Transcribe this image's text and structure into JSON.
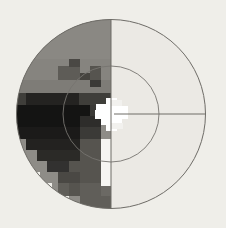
{
  "figure": {
    "name": "visual-field-grayscale-plot",
    "title": "",
    "background_color": "#efeee9"
  },
  "chart_data": {
    "type": "heatmap",
    "title": "",
    "subtitle": "",
    "xlabel": "",
    "ylabel": "",
    "legend": [],
    "annotations": [],
    "grid": false,
    "projection": "polar",
    "xlim": [
      -30,
      30
    ],
    "ylim": [
      -30,
      30
    ],
    "center": {
      "x": 111,
      "y": 114
    },
    "cell_size": 10.5,
    "geometry": {
      "outer_circle_radius": 95,
      "inner_circle_radius": 48,
      "vertical_meridian": true,
      "horizontal_meridian_right_only": true,
      "fixation_marker": "white-star-cross"
    },
    "gray_levels": {
      "background": "#efeee9",
      "near_white": "#ffffff",
      "very_light": "#ebe9e4",
      "light": "#dedcd6",
      "mid_light": "#bdbab3",
      "mid": "#8e8c87",
      "mid_dark": "#66645f",
      "dark": "#3b3a37",
      "very_dark": "#1b1a19",
      "black": "#0d0d0c",
      "line": "#6e6c67"
    },
    "cells": [
      {
        "cx": -5,
        "cy": 5,
        "w": 1,
        "h": 1,
        "level": "mid"
      },
      {
        "cx": -4,
        "cy": 5,
        "w": 1,
        "h": 1,
        "level": "mid"
      },
      {
        "cx": -3,
        "cy": 5,
        "w": 1,
        "h": 1,
        "level": "mid"
      },
      {
        "cx": -2,
        "cy": 5,
        "w": 1,
        "h": 1,
        "level": "mid"
      },
      {
        "cx": -1,
        "cy": 5,
        "w": 1,
        "h": 1,
        "level": "mid"
      },
      {
        "cx": -6,
        "cy": 4,
        "w": 1,
        "h": 1,
        "level": "mid"
      },
      {
        "cx": -5,
        "cy": 4,
        "w": 1,
        "h": 1,
        "level": "mid"
      },
      {
        "cx": -4,
        "cy": 4,
        "w": 1,
        "h": 1,
        "level": "mid"
      },
      {
        "cx": -3,
        "cy": 4,
        "w": 1,
        "h": 1,
        "level": "mid"
      },
      {
        "cx": -2,
        "cy": 4,
        "w": 1,
        "h": 1,
        "level": "mid"
      },
      {
        "cx": -1,
        "cy": 4,
        "w": 1,
        "h": 1,
        "level": "mid"
      },
      {
        "cx": -7,
        "cy": 3,
        "w": 1,
        "h": 1,
        "level": "mid"
      },
      {
        "cx": -6,
        "cy": 3,
        "w": 1,
        "h": 1,
        "level": "mid"
      },
      {
        "cx": -5,
        "cy": 3,
        "w": 1,
        "h": 1,
        "level": "mid"
      },
      {
        "cx": -4,
        "cy": 3,
        "w": 1,
        "h": 1,
        "level": "mid"
      },
      {
        "cx": -3,
        "cy": 3,
        "w": 1,
        "h": 1,
        "level": "mid"
      },
      {
        "cx": -2,
        "cy": 3,
        "w": 1,
        "h": 1,
        "level": "mid"
      },
      {
        "cx": -1,
        "cy": 3,
        "w": 1,
        "h": 1,
        "level": "mid"
      },
      {
        "cx": -8,
        "cy": 2,
        "w": 1,
        "h": 1,
        "level": "mid"
      },
      {
        "cx": -7,
        "cy": 2,
        "w": 1,
        "h": 1,
        "level": "mid"
      },
      {
        "cx": -6,
        "cy": 2,
        "w": 1,
        "h": 1,
        "level": "mid"
      },
      {
        "cx": -5,
        "cy": 2,
        "w": 1,
        "h": 1,
        "level": "mid"
      },
      {
        "cx": -4,
        "cy": 2,
        "w": 1,
        "h": 1,
        "level": "mid"
      },
      {
        "cx": -3,
        "cy": 2,
        "w": 1,
        "h": 1,
        "level": "mid_dark"
      },
      {
        "cx": -2,
        "cy": 2,
        "w": 1,
        "h": 1,
        "level": "dark"
      },
      {
        "cx": -1,
        "cy": 2,
        "w": 1,
        "h": 1,
        "level": "mid_dark"
      },
      {
        "cx": -8,
        "cy": 1,
        "w": 1,
        "h": 1,
        "level": "mid"
      },
      {
        "cx": -7,
        "cy": 1,
        "w": 1,
        "h": 1,
        "level": "mid_dark"
      },
      {
        "cx": -6,
        "cy": 1,
        "w": 1,
        "h": 1,
        "level": "dark"
      },
      {
        "cx": -5,
        "cy": 1,
        "w": 1,
        "h": 1,
        "level": "very_dark"
      },
      {
        "cx": -4,
        "cy": 1,
        "w": 1,
        "h": 1,
        "level": "very_dark"
      },
      {
        "cx": -3,
        "cy": 1,
        "w": 1,
        "h": 1,
        "level": "dark"
      },
      {
        "cx": -2,
        "cy": 1,
        "w": 1,
        "h": 1,
        "level": "mid_dark"
      },
      {
        "cx": -1,
        "cy": 1,
        "w": 1,
        "h": 1,
        "level": "mid"
      },
      {
        "cx": -8,
        "cy": 0,
        "w": 1,
        "h": 1,
        "level": "very_dark"
      },
      {
        "cx": -7,
        "cy": 0,
        "w": 1,
        "h": 1,
        "level": "black"
      },
      {
        "cx": -6,
        "cy": 0,
        "w": 1,
        "h": 1,
        "level": "black"
      },
      {
        "cx": -5,
        "cy": 0,
        "w": 1,
        "h": 1,
        "level": "very_dark"
      },
      {
        "cx": -4,
        "cy": 0,
        "w": 1,
        "h": 1,
        "level": "very_dark"
      },
      {
        "cx": -3,
        "cy": 0,
        "w": 1,
        "h": 1,
        "level": "dark"
      },
      {
        "cx": -2,
        "cy": 0,
        "w": 1,
        "h": 1,
        "level": "mid_dark"
      },
      {
        "cx": -1,
        "cy": 0,
        "w": 1,
        "h": 1,
        "level": "near_white"
      },
      {
        "cx": -8,
        "cy": -1,
        "w": 1,
        "h": 1,
        "level": "black"
      },
      {
        "cx": -7,
        "cy": -1,
        "w": 1,
        "h": 1,
        "level": "black"
      },
      {
        "cx": -6,
        "cy": -1,
        "w": 1,
        "h": 1,
        "level": "black"
      },
      {
        "cx": -5,
        "cy": -1,
        "w": 1,
        "h": 1,
        "level": "very_dark"
      },
      {
        "cx": -4,
        "cy": -1,
        "w": 1,
        "h": 1,
        "level": "very_dark"
      },
      {
        "cx": -3,
        "cy": -1,
        "w": 1,
        "h": 1,
        "level": "very_dark"
      },
      {
        "cx": -2,
        "cy": -1,
        "w": 1,
        "h": 1,
        "level": "dark"
      },
      {
        "cx": -1,
        "cy": -1,
        "w": 1,
        "h": 1,
        "level": "mid_dark"
      },
      {
        "cx": -7,
        "cy": -2,
        "w": 1,
        "h": 1,
        "level": "black"
      },
      {
        "cx": -6,
        "cy": -2,
        "w": 1,
        "h": 1,
        "level": "black"
      },
      {
        "cx": -5,
        "cy": -2,
        "w": 1,
        "h": 1,
        "level": "very_dark"
      },
      {
        "cx": -4,
        "cy": -2,
        "w": 1,
        "h": 1,
        "level": "very_dark"
      },
      {
        "cx": -3,
        "cy": -2,
        "w": 1,
        "h": 1,
        "level": "very_dark"
      },
      {
        "cx": -2,
        "cy": -2,
        "w": 1,
        "h": 1,
        "level": "dark"
      },
      {
        "cx": -1,
        "cy": -2,
        "w": 1,
        "h": 1,
        "level": "mid_dark"
      },
      {
        "cx": -7,
        "cy": -3,
        "w": 1,
        "h": 1,
        "level": "very_dark"
      },
      {
        "cx": -6,
        "cy": -3,
        "w": 1,
        "h": 1,
        "level": "very_dark"
      },
      {
        "cx": -5,
        "cy": -3,
        "w": 1,
        "h": 1,
        "level": "very_dark"
      },
      {
        "cx": -4,
        "cy": -3,
        "w": 1,
        "h": 1,
        "level": "dark"
      },
      {
        "cx": -3,
        "cy": -3,
        "w": 1,
        "h": 1,
        "level": "dark"
      },
      {
        "cx": -2,
        "cy": -3,
        "w": 1,
        "h": 1,
        "level": "mid_dark"
      },
      {
        "cx": -1,
        "cy": -3,
        "w": 1,
        "h": 1,
        "level": "mid_dark"
      },
      {
        "cx": -6,
        "cy": -4,
        "w": 1,
        "h": 1,
        "level": "very_dark"
      },
      {
        "cx": -5,
        "cy": -4,
        "w": 1,
        "h": 1,
        "level": "dark"
      },
      {
        "cx": -4,
        "cy": -4,
        "w": 1,
        "h": 1,
        "level": "dark"
      },
      {
        "cx": -3,
        "cy": -4,
        "w": 1,
        "h": 1,
        "level": "mid_dark"
      },
      {
        "cx": -2,
        "cy": -4,
        "w": 1,
        "h": 1,
        "level": "mid_dark"
      },
      {
        "cx": -1,
        "cy": -4,
        "w": 1,
        "h": 1,
        "level": "mid_dark"
      },
      {
        "cx": -5,
        "cy": -5,
        "w": 1,
        "h": 1,
        "level": "mid_dark"
      },
      {
        "cx": -4,
        "cy": -5,
        "w": 1,
        "h": 1,
        "level": "mid_dark"
      },
      {
        "cx": -3,
        "cy": -5,
        "w": 1,
        "h": 1,
        "level": "mid_dark"
      },
      {
        "cx": -2,
        "cy": -5,
        "w": 1,
        "h": 1,
        "level": "mid_dark"
      },
      {
        "cx": -1,
        "cy": -5,
        "w": 1,
        "h": 1,
        "level": "mid_dark"
      },
      {
        "cx": -4,
        "cy": -6,
        "w": 1,
        "h": 1,
        "level": "mid_dark"
      },
      {
        "cx": -3,
        "cy": -6,
        "w": 1,
        "h": 1,
        "level": "mid_dark"
      },
      {
        "cx": -2,
        "cy": -6,
        "w": 1,
        "h": 1,
        "level": "mid_dark"
      },
      {
        "cx": -1,
        "cy": -6,
        "w": 1,
        "h": 1,
        "level": "mid_dark"
      },
      {
        "cx": -3,
        "cy": -7,
        "w": 1,
        "h": 1,
        "level": "mid_dark"
      },
      {
        "cx": -2,
        "cy": -7,
        "w": 1,
        "h": 1,
        "level": "mid_dark"
      },
      {
        "cx": -1,
        "cy": -7,
        "w": 1,
        "h": 1,
        "level": "mid_dark"
      }
    ],
    "right_hemifield_level": "very_light",
    "fixation": {
      "x": 0,
      "y": 0,
      "shape": "star",
      "color": "#ffffff"
    }
  }
}
